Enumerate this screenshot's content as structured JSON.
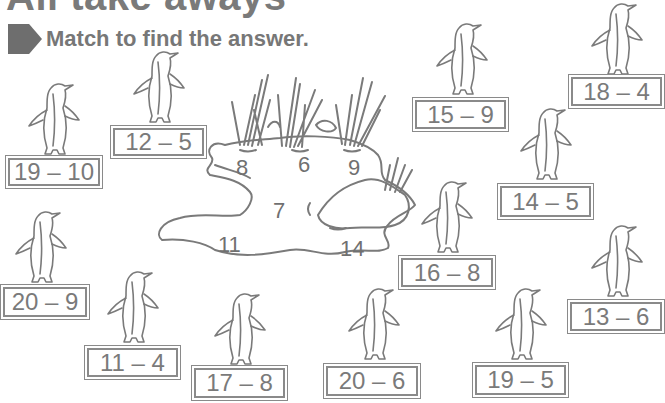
{
  "page": {
    "title": "All take aways",
    "instruction": "Match to find the answer.",
    "instruction_icon": "arrow-pentagon-icon"
  },
  "pond": {
    "answers": [
      {
        "value": "8",
        "x": 236,
        "y": 155
      },
      {
        "value": "6",
        "x": 298,
        "y": 152
      },
      {
        "value": "9",
        "x": 348,
        "y": 155
      },
      {
        "value": "7",
        "x": 273,
        "y": 198
      },
      {
        "value": "11",
        "x": 218,
        "y": 232
      },
      {
        "value": "14",
        "x": 340,
        "y": 236
      }
    ]
  },
  "cards": [
    {
      "expr": "12 – 5",
      "x": 110,
      "y": 125,
      "w": 97,
      "h": 34,
      "px": 130,
      "py": 48
    },
    {
      "expr": "19 – 10",
      "x": 5,
      "y": 155,
      "w": 98,
      "h": 34,
      "px": 25,
      "py": 80
    },
    {
      "expr": "15 – 9",
      "x": 412,
      "y": 97,
      "w": 97,
      "h": 35,
      "px": 433,
      "py": 20
    },
    {
      "expr": "18 – 4",
      "x": 568,
      "y": 74,
      "w": 97,
      "h": 35,
      "px": 588,
      "py": 0
    },
    {
      "expr": "14 – 5",
      "x": 497,
      "y": 183,
      "w": 97,
      "h": 37,
      "px": 517,
      "py": 105
    },
    {
      "expr": "20 – 9",
      "x": 0,
      "y": 284,
      "w": 90,
      "h": 36,
      "px": 12,
      "py": 208
    },
    {
      "expr": "16 – 8",
      "x": 398,
      "y": 255,
      "w": 98,
      "h": 35,
      "px": 418,
      "py": 178
    },
    {
      "expr": "13 – 6",
      "x": 567,
      "y": 299,
      "w": 98,
      "h": 35,
      "px": 588,
      "py": 222
    },
    {
      "expr": "11 – 4",
      "x": 84,
      "y": 345,
      "w": 97,
      "h": 35,
      "px": 104,
      "py": 268
    },
    {
      "expr": "17 – 8",
      "x": 191,
      "y": 365,
      "w": 97,
      "h": 36,
      "px": 211,
      "py": 290
    },
    {
      "expr": "20 – 6",
      "x": 323,
      "y": 363,
      "w": 98,
      "h": 36,
      "px": 345,
      "py": 285
    },
    {
      "expr": "19 – 5",
      "x": 472,
      "y": 362,
      "w": 97,
      "h": 36,
      "px": 492,
      "py": 285
    }
  ],
  "colors": {
    "ink": "#7a7a7a",
    "line": "#8a8a8a",
    "background": "#ffffff"
  }
}
